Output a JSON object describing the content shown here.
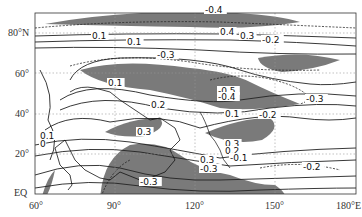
{
  "map": {
    "type": "contour",
    "region": {
      "lon_range": [
        60,
        180
      ],
      "lat_range": [
        0,
        90
      ]
    },
    "axes": {
      "x_ticks": [
        "60°",
        "90°",
        "120°",
        "150°",
        "180°E"
      ],
      "y_ticks": [
        "EQ",
        "20°",
        "40°",
        "60°",
        "80°N"
      ]
    },
    "contour_labels": [
      {
        "text": "-0.4",
        "x": 205,
        "y": 13
      },
      {
        "text": "0.1",
        "x": 92,
        "y": 39
      },
      {
        "text": "0.1",
        "x": 127,
        "y": 45
      },
      {
        "text": "-0.3",
        "x": 157,
        "y": 58
      },
      {
        "text": "0.4",
        "x": 220,
        "y": 35
      },
      {
        "text": "0.3",
        "x": 240,
        "y": 39
      },
      {
        "text": "-0.2",
        "x": 262,
        "y": 43
      },
      {
        "text": "0.1",
        "x": 108,
        "y": 86
      },
      {
        "text": "0.2",
        "x": 151,
        "y": 108
      },
      {
        "text": "-0.5",
        "x": 218,
        "y": 94
      },
      {
        "text": "-0.4",
        "x": 218,
        "y": 100
      },
      {
        "text": "-0.3",
        "x": 306,
        "y": 102
      },
      {
        "text": "0.1",
        "x": 225,
        "y": 117
      },
      {
        "text": "-0.2",
        "x": 259,
        "y": 118
      },
      {
        "text": "0.3",
        "x": 137,
        "y": 135
      },
      {
        "text": "0.1",
        "x": 40,
        "y": 139
      },
      {
        "text": "0",
        "x": 40,
        "y": 147
      },
      {
        "text": "0.3",
        "x": 225,
        "y": 147
      },
      {
        "text": "0.2",
        "x": 225,
        "y": 154
      },
      {
        "text": "-0.1",
        "x": 230,
        "y": 161
      },
      {
        "text": "0.3",
        "x": 200,
        "y": 163
      },
      {
        "text": "-0.3",
        "x": 200,
        "y": 172
      },
      {
        "text": "-0.2",
        "x": 303,
        "y": 170
      },
      {
        "text": "-0.3",
        "x": 140,
        "y": 185
      }
    ],
    "shading": {
      "negative_fill": "#777777",
      "line_color": "#222222",
      "grid_color": "#999999"
    }
  }
}
